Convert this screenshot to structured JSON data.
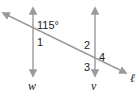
{
  "diagram": {
    "type": "parallel-lines-transversal",
    "line_color": "#9a9a9a",
    "lines": [
      {
        "name": "w",
        "label": "w",
        "orientation": "vertical"
      },
      {
        "name": "v",
        "label": "v",
        "orientation": "vertical"
      },
      {
        "name": "l",
        "label": "ℓ",
        "orientation": "transversal"
      }
    ],
    "angle_labels": {
      "given": "115°",
      "a1": "1",
      "a2": "2",
      "a3": "3",
      "a4": "4"
    }
  }
}
